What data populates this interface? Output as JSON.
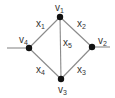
{
  "diagram": {
    "type": "graph",
    "colors": {
      "edge": "#8a8a8a",
      "node": "#111111",
      "text": "#333333"
    },
    "nodes": [
      {
        "id": "v1",
        "label": "v",
        "sub": "1",
        "x": 60,
        "y": 17
      },
      {
        "id": "v2",
        "label": "v",
        "sub": "2",
        "x": 92,
        "y": 47
      },
      {
        "id": "v3",
        "label": "v",
        "sub": "3",
        "x": 61,
        "y": 79
      },
      {
        "id": "v4",
        "label": "v",
        "sub": "4",
        "x": 29,
        "y": 48
      }
    ],
    "edges": [
      {
        "id": "x1",
        "from": "v4",
        "to": "v1",
        "label": "x",
        "sub": "1"
      },
      {
        "id": "x2",
        "from": "v1",
        "to": "v2",
        "label": "x",
        "sub": "2"
      },
      {
        "id": "x3",
        "from": "v3",
        "to": "v2",
        "label": "x",
        "sub": "3"
      },
      {
        "id": "x4",
        "from": "v4",
        "to": "v3",
        "label": "x",
        "sub": "4"
      },
      {
        "id": "x5",
        "from": "v1",
        "to": "v3",
        "label": "x",
        "sub": "5"
      }
    ],
    "stubs": [
      {
        "id": "left-stub",
        "x1": 7,
        "y1": 48,
        "x2": 29,
        "y2": 48
      },
      {
        "id": "right-stub",
        "x1": 92,
        "y1": 47,
        "x2": 110,
        "y2": 47
      }
    ]
  }
}
